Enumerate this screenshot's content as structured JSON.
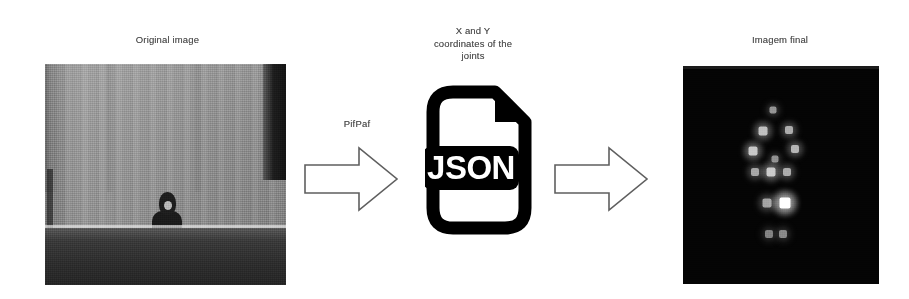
{
  "diagram": {
    "title_flow": "PifPaf pose-estimation pipeline",
    "background_color": "#ffffff",
    "text_color": "#4a4a4a"
  },
  "stages": {
    "original": {
      "caption": "Original image",
      "photo_name": "grayscale-photo-person-in-front-of-wall",
      "palette": {
        "wall": "#949494",
        "ground": "#2e2e2e",
        "person": "#1b1b1b",
        "dark_band": "#141414"
      }
    },
    "json": {
      "caption": "X and Y\ncoordinates of the\njoints",
      "badge_text": "JSON",
      "icon_name": "json-file-icon",
      "icon_color": "#000000",
      "icon_fill": "#ffffff"
    },
    "final": {
      "caption": "Imagem final",
      "photo_name": "keypoint-heatmap-black-background",
      "background_color": "#040404"
    }
  },
  "connectors": {
    "arrow_1": {
      "label": "PifPaf",
      "name": "arrow-original-to-json",
      "stroke": "#5a5a5a",
      "fill": "#ffffff"
    },
    "arrow_2": {
      "label": "",
      "name": "arrow-json-to-final",
      "stroke": "#5a5a5a",
      "fill": "#ffffff"
    }
  },
  "chart_data": {
    "type": "scatter",
    "title": "Imagem final",
    "xlabel": "",
    "ylabel": "",
    "xlim": [
      0,
      196
    ],
    "ylim": [
      0,
      218
    ],
    "grid": false,
    "legend": "none",
    "note": "Keypoint heatmap blobs rendered as bright squares on black background; intensity 0-1.",
    "points": [
      {
        "name": "nose",
        "x": 90,
        "y": 44,
        "size": 7,
        "intensity": 0.42
      },
      {
        "name": "left-shoulder",
        "x": 80,
        "y": 65,
        "size": 9,
        "intensity": 0.66
      },
      {
        "name": "right-shoulder",
        "x": 106,
        "y": 64,
        "size": 8,
        "intensity": 0.55
      },
      {
        "name": "left-elbow",
        "x": 70,
        "y": 85,
        "size": 9,
        "intensity": 0.7
      },
      {
        "name": "right-elbow",
        "x": 112,
        "y": 83,
        "size": 8,
        "intensity": 0.6
      },
      {
        "name": "chest-center",
        "x": 92,
        "y": 93,
        "size": 7,
        "intensity": 0.4
      },
      {
        "name": "left-hip",
        "x": 72,
        "y": 106,
        "size": 8,
        "intensity": 0.52
      },
      {
        "name": "mid-hip",
        "x": 88,
        "y": 106,
        "size": 9,
        "intensity": 0.72
      },
      {
        "name": "right-hip",
        "x": 104,
        "y": 106,
        "size": 8,
        "intensity": 0.55
      },
      {
        "name": "left-knee",
        "x": 84,
        "y": 137,
        "size": 9,
        "intensity": 0.5
      },
      {
        "name": "right-knee",
        "x": 102,
        "y": 137,
        "size": 11,
        "intensity": 1.0
      },
      {
        "name": "left-ankle",
        "x": 86,
        "y": 168,
        "size": 8,
        "intensity": 0.33
      },
      {
        "name": "right-ankle",
        "x": 100,
        "y": 168,
        "size": 8,
        "intensity": 0.36
      }
    ]
  }
}
